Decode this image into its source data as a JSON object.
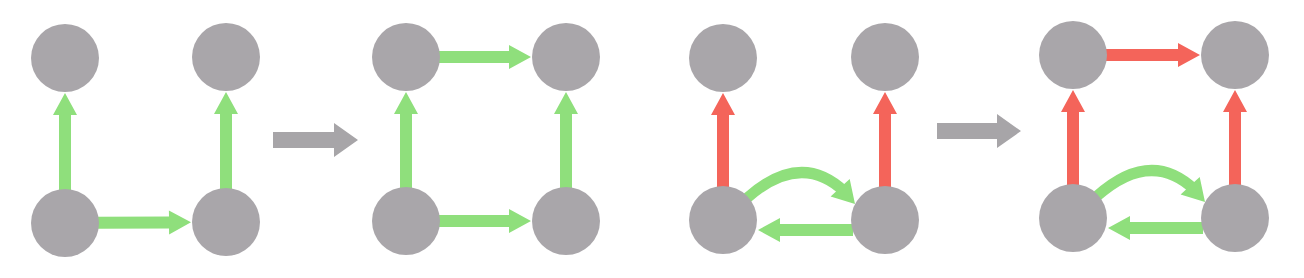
{
  "colors": {
    "node": "#a9a6aa",
    "green": "#8fdf7c",
    "red": "#f4645a",
    "transition": "#a7a5a8",
    "background": "#ffffff"
  },
  "node_radius": 34,
  "panels": [
    {
      "id": "panel-1",
      "nodes": {
        "tl": [
          65,
          58
        ],
        "tr": [
          226,
          57
        ],
        "bl": [
          65,
          223
        ],
        "br": [
          226,
          222
        ]
      },
      "edges": [
        {
          "from": "bl",
          "to": "tl",
          "color": "green",
          "shape": "straight"
        },
        {
          "from": "br",
          "to": "tr",
          "color": "green",
          "shape": "straight"
        },
        {
          "from": "bl",
          "to": "br",
          "color": "green",
          "shape": "straight"
        }
      ]
    },
    {
      "id": "panel-2",
      "nodes": {
        "tl": [
          406,
          57
        ],
        "tr": [
          566,
          57
        ],
        "bl": [
          406,
          221
        ],
        "br": [
          566,
          221
        ]
      },
      "edges": [
        {
          "from": "bl",
          "to": "tl",
          "color": "green",
          "shape": "straight"
        },
        {
          "from": "br",
          "to": "tr",
          "color": "green",
          "shape": "straight"
        },
        {
          "from": "bl",
          "to": "br",
          "color": "green",
          "shape": "straight"
        },
        {
          "from": "tl",
          "to": "tr",
          "color": "green",
          "shape": "straight"
        }
      ]
    },
    {
      "id": "panel-3",
      "nodes": {
        "tl": [
          723,
          58
        ],
        "tr": [
          885,
          57
        ],
        "bl": [
          723,
          220
        ],
        "br": [
          885,
          220
        ]
      },
      "edges": [
        {
          "from": "bl",
          "to": "tl",
          "color": "red",
          "shape": "straight"
        },
        {
          "from": "br",
          "to": "tr",
          "color": "red",
          "shape": "straight"
        },
        {
          "from": "bl",
          "to": "br",
          "color": "green",
          "shape": "curved"
        },
        {
          "from": "br",
          "to": "bl",
          "color": "green",
          "shape": "straight"
        }
      ]
    },
    {
      "id": "panel-4",
      "nodes": {
        "tl": [
          1073,
          55
        ],
        "tr": [
          1235,
          55
        ],
        "bl": [
          1073,
          218
        ],
        "br": [
          1235,
          218
        ]
      },
      "edges": [
        {
          "from": "bl",
          "to": "tl",
          "color": "red",
          "shape": "straight"
        },
        {
          "from": "br",
          "to": "tr",
          "color": "red",
          "shape": "straight"
        },
        {
          "from": "tl",
          "to": "tr",
          "color": "red",
          "shape": "straight"
        },
        {
          "from": "bl",
          "to": "br",
          "color": "green",
          "shape": "curved"
        },
        {
          "from": "br",
          "to": "bl",
          "color": "green",
          "shape": "straight"
        }
      ]
    }
  ],
  "transitions": [
    {
      "id": "transition-1",
      "x1": 273,
      "x2": 358,
      "y": 140
    },
    {
      "id": "transition-2",
      "x1": 937,
      "x2": 1021,
      "y": 131
    }
  ]
}
